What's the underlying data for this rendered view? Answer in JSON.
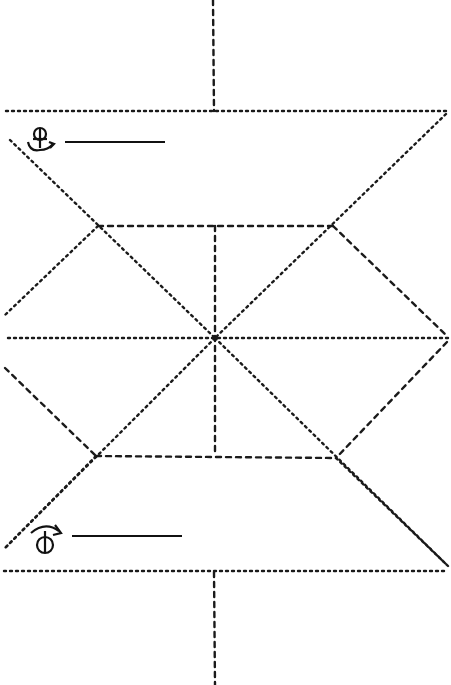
{
  "diagram": {
    "type": "crease-pattern",
    "canvas": {
      "width": 451,
      "height": 685,
      "background": "#ffffff",
      "ink": "#1a1a1a"
    },
    "outer_rect": {
      "top": 111,
      "bottom": 571,
      "left": 5,
      "right": 448
    },
    "inner_rect": {
      "top": 226,
      "bottom": 457,
      "left": 98,
      "right": 333
    },
    "center": {
      "x": 215,
      "y": 338
    },
    "center_vertical": {
      "x": 215,
      "top_stub": [
        0,
        111
      ],
      "bottom_stub": [
        571,
        685
      ],
      "inner": [
        226,
        457
      ]
    },
    "midline_y": 338,
    "symbols": [
      {
        "name": "top-fold-symbol",
        "icon": "anchor-fold-icon",
        "x": 40,
        "y": 140,
        "line_to_x": 165
      },
      {
        "name": "bottom-fold-symbol",
        "icon": "rotate-fold-icon",
        "x": 45,
        "y": 538,
        "line_to_x": 182
      }
    ],
    "labels": {
      "top_symbol_label": "",
      "bottom_symbol_label": ""
    }
  }
}
